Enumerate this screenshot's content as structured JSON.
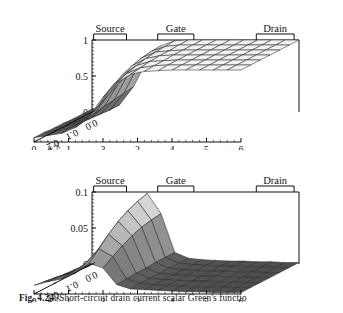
{
  "figure": {
    "caption_prefix": "Fig. 4.24.",
    "caption_text": "Short-circuit drain current scalar Green's functio",
    "ink_color": "#111111",
    "mesh_color": "#2b2b2b",
    "background": "#ffffff"
  },
  "electrodes": {
    "source": "Source",
    "gate": "Gate",
    "drain": "Drain"
  },
  "axes": {
    "x_label": "x",
    "x_unit": ", μm",
    "y_label": "y",
    "y_unit": ", μm",
    "x_ticks": [
      "0",
      "1",
      "3",
      "2",
      "4",
      "5",
      "6"
    ],
    "y_ticks": [
      "0.0",
      "0.1",
      "0.2",
      "0.3"
    ]
  },
  "chart_data": [
    {
      "id": "top",
      "type": "surface",
      "title": "",
      "xlabel": "x, μm",
      "ylabel": "y, μm",
      "zlabel": "",
      "xlim": [
        0,
        6
      ],
      "ylim": [
        0.0,
        0.3
      ],
      "zlim": [
        0,
        1
      ],
      "z_ticks": [
        "1",
        "0.5",
        "0"
      ],
      "x_ticks": [
        "0",
        "1",
        "3",
        "2",
        "4",
        "5",
        "6"
      ],
      "y_ticks": [
        "0.0",
        "0.1",
        "0.2",
        "0.3"
      ],
      "grid": false,
      "legend": "none",
      "annotations": [
        "Source",
        "Gate",
        "Drain"
      ],
      "description": "Scalar Green's function surface rising from ~0 at source end to ~1 plateau beyond the gate toward the drain; steep step under the gate region.",
      "x": [
        0.0,
        0.4,
        0.8,
        1.2,
        1.6,
        2.0,
        2.4,
        2.8,
        3.2,
        3.6,
        4.0,
        4.4,
        4.8,
        5.2,
        5.6,
        6.0
      ],
      "y": [
        0.0,
        0.05,
        0.1,
        0.15,
        0.2,
        0.25,
        0.3
      ],
      "z_rows": [
        [
          0.04,
          0.05,
          0.1,
          0.35,
          0.72,
          0.92,
          0.99,
          1.0,
          1.0,
          1.0,
          1.0,
          1.0,
          1.0,
          1.0,
          1.0,
          1.0
        ],
        [
          0.04,
          0.05,
          0.1,
          0.33,
          0.7,
          0.91,
          0.98,
          1.0,
          1.0,
          1.0,
          1.0,
          1.0,
          1.0,
          1.0,
          1.0,
          1.0
        ],
        [
          0.04,
          0.06,
          0.11,
          0.31,
          0.66,
          0.89,
          0.97,
          0.99,
          1.0,
          1.0,
          1.0,
          1.0,
          1.0,
          1.0,
          1.0,
          1.0
        ],
        [
          0.05,
          0.07,
          0.12,
          0.29,
          0.6,
          0.85,
          0.95,
          0.99,
          1.0,
          1.0,
          1.0,
          1.0,
          1.0,
          1.0,
          1.0,
          1.0
        ],
        [
          0.05,
          0.08,
          0.13,
          0.26,
          0.52,
          0.79,
          0.92,
          0.98,
          0.99,
          1.0,
          1.0,
          1.0,
          1.0,
          1.0,
          1.0,
          1.0
        ],
        [
          0.06,
          0.09,
          0.13,
          0.23,
          0.44,
          0.71,
          0.88,
          0.96,
          0.99,
          1.0,
          1.0,
          1.0,
          1.0,
          1.0,
          1.0,
          1.0
        ],
        [
          0.06,
          0.09,
          0.12,
          0.2,
          0.36,
          0.62,
          0.82,
          0.94,
          0.98,
          0.99,
          1.0,
          1.0,
          1.0,
          1.0,
          1.0,
          1.0
        ]
      ]
    },
    {
      "id": "bottom",
      "type": "surface",
      "title": "",
      "xlabel": "x, μm",
      "ylabel": "y, μm",
      "zlabel": "",
      "xlim": [
        0,
        6
      ],
      "ylim": [
        0.0,
        0.3
      ],
      "zlim": [
        0,
        0.1
      ],
      "z_ticks": [
        "0.1",
        "0.05",
        "0"
      ],
      "x_ticks": [
        "0",
        "1",
        "3",
        "2",
        "4",
        "5",
        "6"
      ],
      "y_ticks": [
        "0.0",
        "0.1",
        "0.2",
        "0.3"
      ],
      "grid": false,
      "legend": "none",
      "annotations": [
        "Source",
        "Gate",
        "Drain"
      ],
      "description": "Sharp ridge peaking near 0.1 under the gate edge, decaying to near zero toward source and drain.",
      "x": [
        0.0,
        0.4,
        0.8,
        1.2,
        1.6,
        2.0,
        2.4,
        2.8,
        3.2,
        3.6,
        4.0,
        4.4,
        4.8,
        5.2,
        5.6,
        6.0
      ],
      "y": [
        0.0,
        0.05,
        0.1,
        0.15,
        0.2,
        0.25,
        0.3
      ],
      "z_rows": [
        [
          0.004,
          0.008,
          0.018,
          0.055,
          0.098,
          0.07,
          0.016,
          0.008,
          0.006,
          0.005,
          0.004,
          0.004,
          0.003,
          0.003,
          0.002,
          0.002
        ],
        [
          0.004,
          0.009,
          0.019,
          0.053,
          0.094,
          0.068,
          0.016,
          0.008,
          0.006,
          0.005,
          0.004,
          0.004,
          0.003,
          0.003,
          0.002,
          0.002
        ],
        [
          0.005,
          0.01,
          0.02,
          0.05,
          0.088,
          0.065,
          0.016,
          0.008,
          0.006,
          0.005,
          0.004,
          0.004,
          0.003,
          0.003,
          0.002,
          0.002
        ],
        [
          0.006,
          0.012,
          0.021,
          0.046,
          0.08,
          0.06,
          0.015,
          0.008,
          0.006,
          0.005,
          0.004,
          0.004,
          0.003,
          0.003,
          0.002,
          0.002
        ],
        [
          0.008,
          0.014,
          0.022,
          0.041,
          0.069,
          0.053,
          0.015,
          0.008,
          0.006,
          0.005,
          0.004,
          0.004,
          0.003,
          0.003,
          0.002,
          0.002
        ],
        [
          0.01,
          0.016,
          0.022,
          0.035,
          0.056,
          0.045,
          0.014,
          0.008,
          0.006,
          0.005,
          0.004,
          0.003,
          0.003,
          0.003,
          0.002,
          0.002
        ],
        [
          0.012,
          0.017,
          0.021,
          0.029,
          0.043,
          0.036,
          0.013,
          0.007,
          0.006,
          0.005,
          0.004,
          0.003,
          0.003,
          0.002,
          0.002,
          0.002
        ]
      ]
    }
  ]
}
